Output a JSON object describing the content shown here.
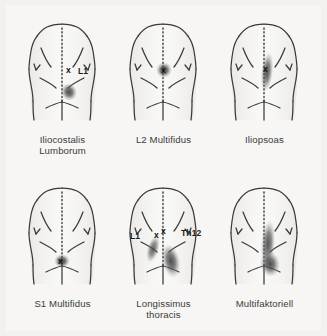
{
  "figure": {
    "background_color": "#f2f1ef",
    "plate_color": "#f7f6f4",
    "outline_color": "#3a3a3a",
    "blob_color": "#4a4a4a",
    "caption_color": "#3b3b3b",
    "marker_glyph": "x",
    "rows": 2,
    "columns": 3
  },
  "panels": [
    {
      "id": "iliocostalis-lumborum",
      "caption_line1": "Iliocostalis",
      "caption_line2": "Lumborum",
      "markers": [
        {
          "glyph": "x",
          "x": 56,
          "y": 62
        }
      ],
      "labels": [
        {
          "text": "L1",
          "x": 68,
          "y": 62
        }
      ],
      "pain_blobs": [
        {
          "cx": 59,
          "cy": 84,
          "rx": 8,
          "ry": 9,
          "rotate": -20,
          "intensity": 0.86
        }
      ]
    },
    {
      "id": "l2-multifidus",
      "caption_line1": "L2 Multifidus",
      "caption_line2": "",
      "markers": [
        {
          "glyph": "x",
          "x": 51,
          "y": 62
        }
      ],
      "labels": [],
      "pain_blobs": [
        {
          "cx": 53,
          "cy": 62,
          "rx": 8,
          "ry": 8,
          "rotate": 0,
          "intensity": 0.88
        }
      ]
    },
    {
      "id": "iliopsoas",
      "caption_line1": "Iliopsoas",
      "caption_line2": "",
      "markers": [
        {
          "glyph": "x",
          "x": 52,
          "y": 61
        }
      ],
      "labels": [],
      "pain_blobs": [
        {
          "cx": 55,
          "cy": 64,
          "rx": 6,
          "ry": 20,
          "rotate": 6,
          "intensity": 0.8
        }
      ]
    },
    {
      "id": "s1-multifidus",
      "caption_line1": "S1 Multifidus",
      "caption_line2": "",
      "markers": [
        {
          "glyph": "x",
          "x": 49,
          "y": 88
        }
      ],
      "labels": [],
      "pain_blobs": [
        {
          "cx": 52,
          "cy": 89,
          "rx": 8,
          "ry": 7,
          "rotate": 0,
          "intensity": 0.88
        }
      ]
    },
    {
      "id": "longissimus-thoracis",
      "caption_line1": "Longissimus",
      "caption_line2": "thoracis",
      "markers": [
        {
          "glyph": "x",
          "x": 44,
          "y": 62
        },
        {
          "glyph": "x",
          "x": 51,
          "y": 59
        }
      ],
      "labels": [
        {
          "text": "L1",
          "x": 21,
          "y": 63
        },
        {
          "text": "Th12",
          "x": 72,
          "y": 60
        }
      ],
      "pain_blobs": [
        {
          "cx": 42,
          "cy": 77,
          "rx": 6,
          "ry": 14,
          "rotate": 16,
          "intensity": 0.74
        },
        {
          "cx": 60,
          "cy": 89,
          "rx": 9,
          "ry": 17,
          "rotate": -12,
          "intensity": 0.84
        }
      ]
    },
    {
      "id": "multifaktoriell",
      "caption_line1": "Multifaktoriell",
      "caption_line2": "",
      "markers": [],
      "labels": [],
      "pain_blobs": [
        {
          "cx": 56,
          "cy": 72,
          "rx": 7,
          "ry": 24,
          "rotate": 4,
          "intensity": 0.82
        },
        {
          "cx": 58,
          "cy": 92,
          "rx": 10,
          "ry": 13,
          "rotate": -8,
          "intensity": 0.86
        }
      ]
    }
  ]
}
